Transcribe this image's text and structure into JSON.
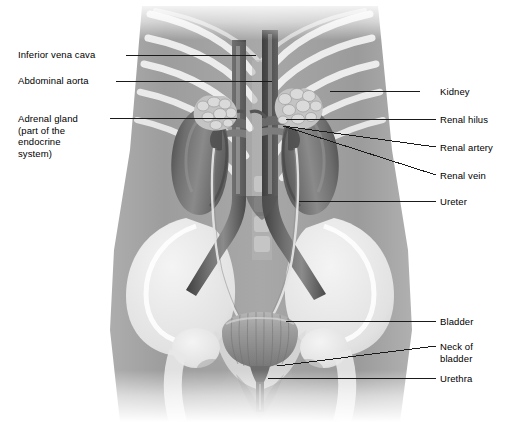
{
  "figure": {
    "style": "grayscale medical illustration of abdomen showing kidneys, great vessels, ureters and bladder over a faint skeleton",
    "background_color": "#ffffff",
    "line_color": "#1a1a1a",
    "text_color": "#000000"
  },
  "labels_left": [
    {
      "id": "inferior-vena-cava",
      "text": "Inferior vena cava",
      "x": 18,
      "y": 49,
      "leader": {
        "x1": 126,
        "y1": 55,
        "x2": 256,
        "y2": 55
      }
    },
    {
      "id": "abdominal-aorta",
      "text": "Abdominal aorta",
      "x": 18,
      "y": 75,
      "leader": {
        "x1": 116,
        "y1": 81,
        "x2": 272,
        "y2": 81
      }
    },
    {
      "id": "adrenal-gland",
      "text": "Adrenal gland\n(part of the\nendocrine\nsystem)",
      "x": 18,
      "y": 113,
      "leader": {
        "x1": 110,
        "y1": 118,
        "x2": 237,
        "y2": 118
      }
    }
  ],
  "labels_right": [
    {
      "id": "kidney",
      "text": "Kidney",
      "x": 440,
      "y": 86,
      "leader": {
        "x1": 420,
        "y1": 91,
        "x2": 330,
        "y2": 91
      }
    },
    {
      "id": "renal-hilus",
      "text": "Renal hilus",
      "x": 440,
      "y": 114,
      "leader": {
        "x1": 436,
        "y1": 119,
        "x2": 286,
        "y2": 119
      }
    },
    {
      "id": "renal-artery",
      "text": "Renal artery",
      "x": 440,
      "y": 142,
      "leader": {
        "x1": 436,
        "y1": 147,
        "x2": 283,
        "y2": 126
      }
    },
    {
      "id": "renal-vein",
      "text": "Renal vein",
      "x": 440,
      "y": 170,
      "leader": {
        "x1": 436,
        "y1": 175,
        "x2": 283,
        "y2": 126
      }
    },
    {
      "id": "ureter",
      "text": "Ureter",
      "x": 440,
      "y": 196,
      "leader": {
        "x1": 436,
        "y1": 201,
        "x2": 299,
        "y2": 201
      }
    },
    {
      "id": "bladder",
      "text": "Bladder",
      "x": 440,
      "y": 316,
      "leader": {
        "x1": 436,
        "y1": 321,
        "x2": 286,
        "y2": 321
      }
    },
    {
      "id": "neck-of-bladder",
      "text": "Neck of\nbladder",
      "x": 440,
      "y": 341,
      "leader": {
        "x1": 436,
        "y1": 346,
        "x2": 277,
        "y2": 366
      }
    },
    {
      "id": "urethra",
      "text": "Urethra",
      "x": 440,
      "y": 373,
      "leader": {
        "x1": 436,
        "y1": 378,
        "x2": 268,
        "y2": 378
      }
    }
  ],
  "organs": [
    {
      "id": "right-kidney",
      "name": "Kidney (viewer left)"
    },
    {
      "id": "left-kidney",
      "name": "Kidney (viewer right)"
    },
    {
      "id": "right-adrenal",
      "name": "Adrenal gland (viewer left)"
    },
    {
      "id": "left-adrenal",
      "name": "Adrenal gland (viewer right)"
    },
    {
      "id": "abdominal-aorta-vessel",
      "name": "Abdominal aorta"
    },
    {
      "id": "inferior-vena-cava-vessel",
      "name": "Inferior vena cava"
    },
    {
      "id": "renal-artery-vessel",
      "name": "Renal artery"
    },
    {
      "id": "renal-vein-vessel",
      "name": "Renal vein"
    },
    {
      "id": "right-ureter",
      "name": "Ureter (viewer left)"
    },
    {
      "id": "left-ureter",
      "name": "Ureter (viewer right)"
    },
    {
      "id": "urinary-bladder",
      "name": "Urinary bladder"
    },
    {
      "id": "bladder-neck",
      "name": "Neck of bladder"
    },
    {
      "id": "urethra-tube",
      "name": "Urethra"
    }
  ],
  "skeleton": [
    {
      "id": "ribcage",
      "name": "Rib cage"
    },
    {
      "id": "pelvis",
      "name": "Pelvic bones"
    },
    {
      "id": "femur-heads",
      "name": "Femoral heads"
    },
    {
      "id": "spine",
      "name": "Lumbar spine"
    }
  ],
  "palette": {
    "torso": "#9a9a9a",
    "bone": "#efefef",
    "organ_mid": "#7d7d7d",
    "organ_dark": "#4a4a4a",
    "organ_light": "#c9c9c9",
    "vessel": "#5a5a5a",
    "line": "#1a1a1a"
  }
}
